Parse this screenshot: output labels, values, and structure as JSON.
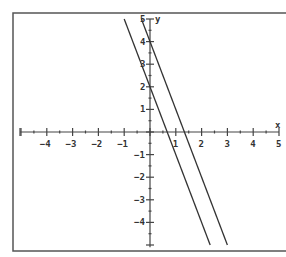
{
  "chart_data": {
    "type": "line",
    "title": "",
    "xlabel": "x",
    "ylabel": "y",
    "xlim": [
      -5,
      5
    ],
    "ylim": [
      -5,
      5
    ],
    "grid": false,
    "x_ticks": [
      -4,
      -3,
      -2,
      -1,
      1,
      2,
      3,
      4,
      5
    ],
    "y_ticks": [
      5,
      4,
      3,
      2,
      1,
      -1,
      -2,
      -3,
      -4
    ],
    "series": [
      {
        "name": "y = -3x + 4",
        "slope": -3,
        "intercept": 4,
        "x": [
          -0.333,
          3
        ],
        "y": [
          5,
          -5
        ]
      },
      {
        "name": "y = -3x + 2",
        "slope": -3,
        "intercept": 2,
        "x": [
          -1,
          2.333
        ],
        "y": [
          5,
          -5
        ]
      }
    ]
  },
  "colors": {
    "line": "#333333",
    "frame": "#555555",
    "axis": "#444444"
  },
  "layout": {
    "origin_px": [
      150,
      132
    ],
    "px_per_x": 25.8,
    "px_per_y": 22.6
  }
}
